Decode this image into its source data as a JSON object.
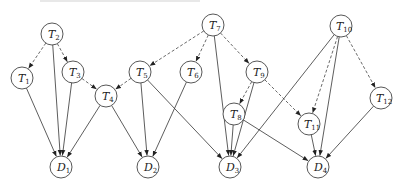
{
  "diagram": {
    "title": "",
    "nodes": [
      {
        "id": "T2",
        "label": "T",
        "sub": "2",
        "x": 52,
        "y": 34
      },
      {
        "id": "T1",
        "label": "T",
        "sub": "1",
        "x": 22,
        "y": 78
      },
      {
        "id": "T3",
        "label": "T",
        "sub": "3",
        "x": 73,
        "y": 72
      },
      {
        "id": "T4",
        "label": "T",
        "sub": "4",
        "x": 106,
        "y": 96
      },
      {
        "id": "T7",
        "label": "T",
        "sub": "7",
        "x": 213,
        "y": 25
      },
      {
        "id": "T5",
        "label": "T",
        "sub": "5",
        "x": 140,
        "y": 72
      },
      {
        "id": "T6",
        "label": "T",
        "sub": "6",
        "x": 191,
        "y": 72
      },
      {
        "id": "T9",
        "label": "T",
        "sub": "9",
        "x": 257,
        "y": 72
      },
      {
        "id": "T8",
        "label": "T",
        "sub": "8",
        "x": 234,
        "y": 114
      },
      {
        "id": "T10",
        "label": "T",
        "sub": "10",
        "x": 341,
        "y": 26
      },
      {
        "id": "T11",
        "label": "T",
        "sub": "11",
        "x": 309,
        "y": 124
      },
      {
        "id": "T12",
        "label": "T",
        "sub": "12",
        "x": 381,
        "y": 98
      },
      {
        "id": "D1",
        "label": "D",
        "sub": "1",
        "x": 61,
        "y": 167
      },
      {
        "id": "D2",
        "label": "D",
        "sub": "2",
        "x": 148,
        "y": 167
      },
      {
        "id": "D3",
        "label": "D",
        "sub": "3",
        "x": 230,
        "y": 167
      },
      {
        "id": "D4",
        "label": "D",
        "sub": "4",
        "x": 318,
        "y": 167
      }
    ],
    "edges": [
      {
        "from": "T2",
        "to": "T1",
        "style": "dashed"
      },
      {
        "from": "T2",
        "to": "T3",
        "style": "dashed"
      },
      {
        "from": "T3",
        "to": "T4",
        "style": "dashed"
      },
      {
        "from": "T5",
        "to": "T4",
        "style": "dashed"
      },
      {
        "from": "T7",
        "to": "T5",
        "style": "dashed"
      },
      {
        "from": "T7",
        "to": "T6",
        "style": "dashed"
      },
      {
        "from": "T7",
        "to": "T9",
        "style": "dashed"
      },
      {
        "from": "T9",
        "to": "T8",
        "style": "dashed"
      },
      {
        "from": "T9",
        "to": "T11",
        "style": "dashed"
      },
      {
        "from": "T10",
        "to": "T11",
        "style": "dashed"
      },
      {
        "from": "T10",
        "to": "T12",
        "style": "dashed"
      },
      {
        "from": "T1",
        "to": "D1",
        "style": "solid"
      },
      {
        "from": "T2",
        "to": "D1",
        "style": "solid"
      },
      {
        "from": "T3",
        "to": "D1",
        "style": "solid"
      },
      {
        "from": "T4",
        "to": "D1",
        "style": "solid"
      },
      {
        "from": "T4",
        "to": "D2",
        "style": "solid"
      },
      {
        "from": "T5",
        "to": "D2",
        "style": "solid"
      },
      {
        "from": "T6",
        "to": "D2",
        "style": "solid"
      },
      {
        "from": "T5",
        "to": "D3",
        "style": "solid"
      },
      {
        "from": "T7",
        "to": "D3",
        "style": "solid"
      },
      {
        "from": "T8",
        "to": "D3",
        "style": "solid"
      },
      {
        "from": "T9",
        "to": "D3",
        "style": "solid"
      },
      {
        "from": "T10",
        "to": "D3",
        "style": "solid"
      },
      {
        "from": "T8",
        "to": "D4",
        "style": "solid"
      },
      {
        "from": "T11",
        "to": "D4",
        "style": "solid"
      },
      {
        "from": "T10",
        "to": "D4",
        "style": "solid"
      },
      {
        "from": "T12",
        "to": "D4",
        "style": "solid"
      }
    ],
    "node_radius": 11,
    "colors": {
      "stroke": "#444444",
      "text": "#222222",
      "background": "#ffffff"
    }
  }
}
